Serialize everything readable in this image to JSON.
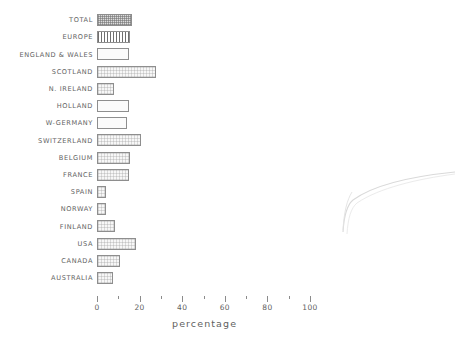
{
  "chart_data": {
    "type": "bar",
    "orientation": "horizontal",
    "title": "",
    "xlabel": "percentage",
    "ylabel": "",
    "xlim": [
      0,
      108
    ],
    "grid": false,
    "legend": null,
    "axis": {
      "major_ticks": [
        0,
        20,
        40,
        60,
        80,
        100
      ],
      "major_tick_labels": [
        "0",
        "20",
        "40",
        "60",
        "80",
        "100"
      ],
      "minor_ticks": [
        10,
        30,
        50,
        70,
        90
      ]
    },
    "categories": [
      "TOTAL",
      "EUROPE",
      "ENGLAND & WALES",
      "SCOTLAND",
      "N. IRELAND",
      "HOLLAND",
      "W-GERMANY",
      "SWITZERLAND",
      "BELGIUM",
      "FRANCE",
      "SPAIN",
      "NORWAY",
      "FINLAND",
      "USA",
      "CANADA",
      "AUSTRALIA"
    ],
    "values": [
      16.5,
      15.5,
      15.0,
      27.5,
      8.0,
      15.0,
      14.0,
      20.5,
      15.5,
      15.0,
      4.0,
      4.0,
      8.5,
      18.5,
      11.0,
      7.5
    ],
    "fills": [
      "checker",
      "vstripe",
      "plain",
      "stipple",
      "stipple",
      "plain",
      "plain",
      "stipple",
      "stipple",
      "stipple",
      "stipple",
      "stipple",
      "stipple",
      "stipple",
      "stipple",
      "stipple"
    ],
    "colors": {
      "bar_edge": "#8e8e8e",
      "bar_face": "#f4f4f4",
      "text": "#5f5f5f",
      "background": "#ffffff"
    }
  },
  "artifact": {
    "name": "scan-edge-curve",
    "description": "faint curved page-edge shadow"
  }
}
